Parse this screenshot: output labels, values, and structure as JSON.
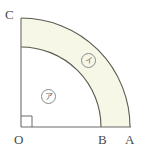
{
  "figure": {
    "colors": {
      "stroke": "#59594f",
      "axis_stroke": "#6b6b6b",
      "shaded_fill": "#f7f7e8",
      "unshaded_fill": "#ffffff",
      "label_text": "#4a4a4a",
      "region_label_text": "#6a6a6a",
      "region_label_ring": "#8c8c8c",
      "background": "#ffffff"
    },
    "geometry": {
      "origin_x": 21,
      "origin_y": 127,
      "inner_radius": 80,
      "outer_radius": 109,
      "right_angle_mark_size": 11,
      "sector_angle_degrees": 90
    },
    "vertices": [
      {
        "id": "C",
        "label": "C",
        "position": "top-of-vertical-axis"
      },
      {
        "id": "O",
        "label": "O",
        "position": "origin"
      },
      {
        "id": "B",
        "label": "B",
        "position": "inner-arc-on-horizontal-axis"
      },
      {
        "id": "A",
        "label": "A",
        "position": "outer-arc-on-horizontal-axis"
      }
    ],
    "regions": [
      {
        "id": "inner",
        "label": "ア",
        "shaded": false,
        "description": "inner quarter disc OB"
      },
      {
        "id": "outer",
        "label": "イ",
        "shaded": true,
        "description": "annular sector between arc B and arc A"
      }
    ]
  }
}
